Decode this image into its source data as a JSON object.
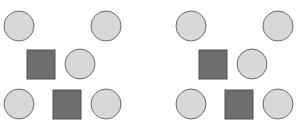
{
  "diagram": {
    "colors": {
      "circle_fill": "#d8d8d8",
      "circle_stroke": "#6b6b6b",
      "square_fill": "#6e6e6e",
      "square_stroke": "#505050",
      "background": "#ffffff"
    },
    "panels": [
      {
        "name": "left",
        "shapes": [
          {
            "type": "circle",
            "row": 1,
            "col": 1
          },
          {
            "type": "circle",
            "row": 1,
            "col": 4
          },
          {
            "type": "square",
            "row": 2,
            "col": 2
          },
          {
            "type": "circle",
            "row": 2,
            "col": 3
          },
          {
            "type": "circle",
            "row": 3,
            "col": 1
          },
          {
            "type": "square",
            "row": 3,
            "col": 3
          },
          {
            "type": "circle",
            "row": 3,
            "col": 4
          }
        ]
      },
      {
        "name": "right",
        "shapes": [
          {
            "type": "circle",
            "row": 1,
            "col": 1
          },
          {
            "type": "circle",
            "row": 1,
            "col": 4
          },
          {
            "type": "square",
            "row": 2,
            "col": 2
          },
          {
            "type": "circle",
            "row": 2,
            "col": 3
          },
          {
            "type": "circle",
            "row": 3,
            "col": 1
          },
          {
            "type": "square",
            "row": 3,
            "col": 3
          },
          {
            "type": "circle",
            "row": 3,
            "col": 4
          }
        ]
      }
    ]
  }
}
